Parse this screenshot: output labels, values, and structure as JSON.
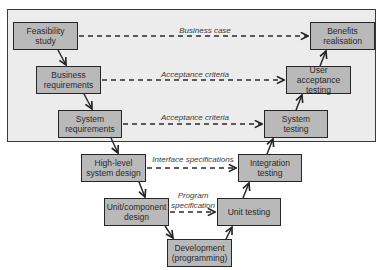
{
  "diagram": {
    "type": "V-model",
    "colors": {
      "box_fill": "#b9b9b9",
      "box_border": "#262626",
      "panel_fill": "#ececec",
      "line": "#2a2a2a"
    },
    "left_branch": [
      {
        "id": "feasibility",
        "label": "Feasibility study"
      },
      {
        "id": "business_req",
        "label": "Business requirements"
      },
      {
        "id": "system_req",
        "label": "System requirements"
      },
      {
        "id": "high_level",
        "label": "High-level system design"
      },
      {
        "id": "unit_design",
        "label": "Unit/component design"
      }
    ],
    "bottom": {
      "id": "development",
      "label": "Development (programming)"
    },
    "right_branch": [
      {
        "id": "unit_testing",
        "label": "Unit testing"
      },
      {
        "id": "integration",
        "label": "Integration testing"
      },
      {
        "id": "system_testing",
        "label": "System testing"
      },
      {
        "id": "uat",
        "label": "User acceptance testing"
      },
      {
        "id": "benefits",
        "label": "Benefits realisation"
      }
    ],
    "links": [
      {
        "from": "feasibility",
        "to": "benefits",
        "label": "Business case"
      },
      {
        "from": "business_req",
        "to": "uat",
        "label": "Acceptance criteria"
      },
      {
        "from": "system_req",
        "to": "system_testing",
        "label": "Acceptance criteria"
      },
      {
        "from": "high_level",
        "to": "integration",
        "label": "Interface specifications"
      },
      {
        "from": "unit_design",
        "to": "unit_testing",
        "label": "Program specification"
      }
    ]
  },
  "boxes": {
    "feasibility": "Feasibility study",
    "business_req": "Business requirements",
    "system_req": "System requirements",
    "high_level": "High-level system design",
    "unit_design": "Unit/component design",
    "development": "Development (programming)",
    "unit_testing": "Unit testing",
    "integration": "Integration testing",
    "system_testing": "System testing",
    "uat": "User acceptance testing",
    "benefits": "Benefits realisation"
  },
  "link_labels": {
    "business_case": "Business case",
    "acceptance_1": "Acceptance criteria",
    "acceptance_2": "Acceptance criteria",
    "interface": "Interface specifications",
    "program": "Program specification"
  }
}
